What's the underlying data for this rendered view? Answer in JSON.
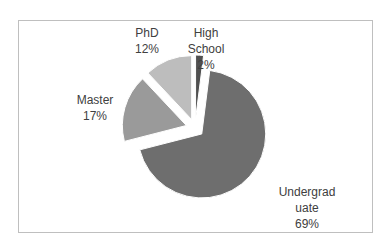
{
  "chart_data": {
    "type": "pie",
    "title": "",
    "exploded": true,
    "start_angle_deg": 0,
    "direction": "clockwise",
    "categories": [
      "High School",
      "Undergraduate",
      "Master",
      "PhD"
    ],
    "values": [
      2,
      69,
      17,
      12
    ],
    "unit": "%",
    "colors": [
      "#505050",
      "#6e6e6e",
      "#9a9a9a",
      "#bdbdbd"
    ],
    "data_labels": [
      {
        "lines": [
          "High",
          "School",
          "2%"
        ]
      },
      {
        "lines": [
          "Undergrad",
          "uate",
          "69%"
        ]
      },
      {
        "lines": [
          "Master",
          "17%"
        ]
      },
      {
        "lines": [
          "PhD",
          "12%"
        ]
      }
    ],
    "legend": "none"
  }
}
